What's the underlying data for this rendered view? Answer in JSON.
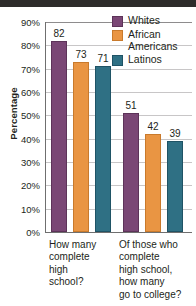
{
  "chart_data": {
    "type": "bar",
    "title": "",
    "subtitle": "",
    "xlabel": "",
    "ylabel": "Percentage",
    "ylim": [
      0,
      90
    ],
    "ytick_values": [
      90,
      80,
      70,
      60,
      50,
      40,
      30,
      20,
      10,
      0
    ],
    "ytick_labels": [
      "90%",
      "80%",
      "70%",
      "60%",
      "50%",
      "40%",
      "30%",
      "20%",
      "10%",
      "0%"
    ],
    "grid": true,
    "grid_axis": "y",
    "legend_position": "top-right",
    "categories": [
      "How many\ncomplete\nhigh\nschool?",
      "Of those who\ncomplete\nhigh school,\nhow many\ngo to college?"
    ],
    "series": [
      {
        "name": "Whites",
        "color": "#7a4775",
        "values": [
          82,
          51
        ]
      },
      {
        "name": "African\nAmericans",
        "color": "#e99543",
        "values": [
          73,
          42
        ]
      },
      {
        "name": "Latinos",
        "color": "#2f7084",
        "values": [
          71,
          39
        ]
      }
    ],
    "data_labels": [
      {
        "group": 0,
        "series": "Whites",
        "value": "82"
      },
      {
        "group": 0,
        "series": "African Americans",
        "value": "73"
      },
      {
        "group": 0,
        "series": "Latinos",
        "value": "71"
      },
      {
        "group": 1,
        "series": "Whites",
        "value": "51"
      },
      {
        "group": 1,
        "series": "African Americans",
        "value": "42"
      },
      {
        "group": 1,
        "series": "Latinos",
        "value": "39"
      }
    ]
  },
  "colors": {
    "whites": "#7a4775",
    "african_americans": "#e99543",
    "latinos": "#2f7084",
    "gridline": "#c8c6c7",
    "axis": "#6f6f6f",
    "text": "#231f20",
    "background": "#ffffff"
  }
}
